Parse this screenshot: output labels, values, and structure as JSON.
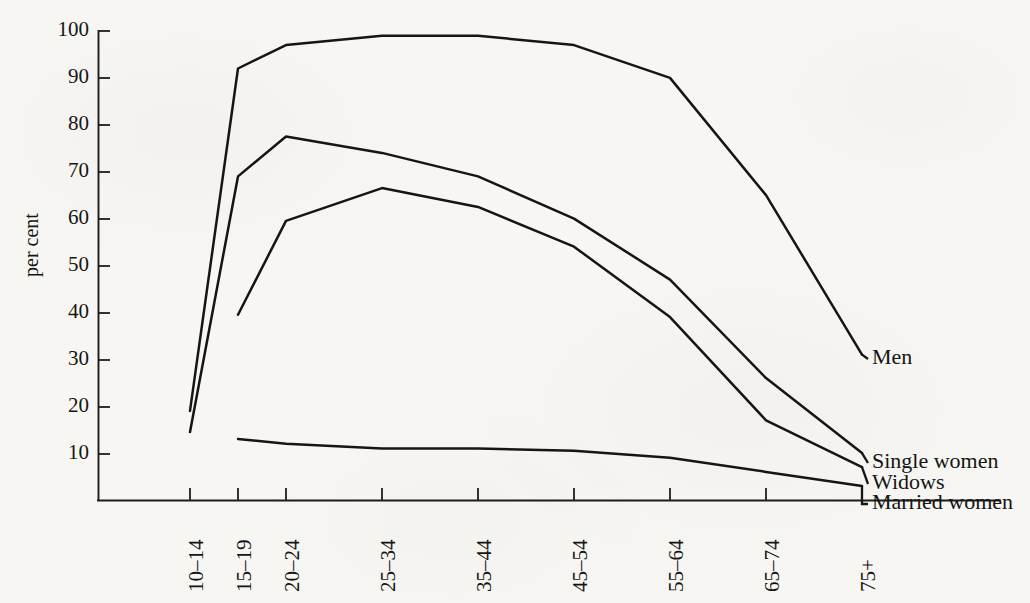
{
  "figure": {
    "background_color": "#f7f6f2",
    "ink_color": "#151515",
    "y_axis_title": "per cent"
  },
  "chart_data": {
    "type": "line",
    "title": "",
    "subtitle": "",
    "xlabel": "",
    "ylabel": "per cent",
    "ylim": [
      0,
      100
    ],
    "y_ticks": [
      10,
      20,
      30,
      40,
      50,
      60,
      70,
      80,
      90,
      100
    ],
    "grid": false,
    "legend_position": "right-inline-labels",
    "categories": [
      "10–14",
      "15–19",
      "20–24",
      "25–34",
      "35–44",
      "45–54",
      "55–64",
      "65–74",
      "75+"
    ],
    "series": [
      {
        "name": "Men",
        "label": "Men",
        "values": [
          19,
          92,
          97,
          99,
          99,
          97,
          90,
          65,
          31
        ]
      },
      {
        "name": "Single women",
        "label": "Single women",
        "values": [
          14.5,
          69,
          77.5,
          74,
          69,
          60,
          47,
          26,
          10
        ]
      },
      {
        "name": "Widows",
        "label": "Widows",
        "values": [
          null,
          39.5,
          59.5,
          66.5,
          62.5,
          54,
          39,
          17,
          7
        ]
      },
      {
        "name": "Married women",
        "label": "Married women",
        "values": [
          null,
          13,
          12,
          11,
          11,
          10.5,
          9,
          6,
          3
        ]
      }
    ]
  },
  "y_tick_labels": [
    "10",
    "20",
    "30",
    "40",
    "50",
    "60",
    "70",
    "80",
    "90",
    "100"
  ],
  "x_tick_labels": [
    "10–14",
    "15–19",
    "20–24",
    "25–34",
    "35–44",
    "45–54",
    "55–64",
    "65–74",
    "75+"
  ],
  "series_labels": {
    "men": "Men",
    "single_women": "Single women",
    "widows": "Widows",
    "married_women": "Married women"
  }
}
